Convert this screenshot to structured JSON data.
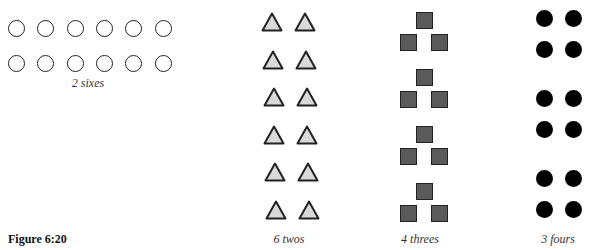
{
  "figure_label": "Figure 6:20",
  "groups": [
    {
      "name": "sixes",
      "caption": "2 sixes",
      "shape": "open-circle",
      "groups": 2,
      "per_group": 6,
      "color": "#222222"
    },
    {
      "name": "twos",
      "caption": "6 twos",
      "shape": "triangle",
      "groups": 6,
      "per_group": 2,
      "fill": "#d9d9d9"
    },
    {
      "name": "threes",
      "caption": "4 threes",
      "shape": "square",
      "groups": 4,
      "per_group": 3,
      "fill": "#5a5a5a"
    },
    {
      "name": "fours",
      "caption": "3 fours",
      "shape": "filled-circle",
      "groups": 3,
      "per_group": 4,
      "fill": "#000000"
    }
  ]
}
